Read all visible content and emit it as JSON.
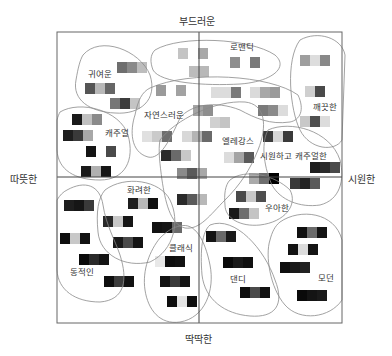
{
  "axes": {
    "top": "부드러운",
    "bottom": "딱딱한",
    "left": "따뜻한",
    "right": "시원한"
  },
  "frame": {
    "x": 57,
    "y": 32,
    "w": 285,
    "h": 291,
    "cx": 199,
    "cy": 177
  },
  "clusters": [
    {
      "id": "cute",
      "label": "귀여운",
      "lx": 88,
      "ly": 70,
      "path": "M 83 55 C 100 35, 140 50, 150 75 C 158 100, 140 115, 115 113 C 90 112, 72 100, 76 80 C 78 68, 80 60, 83 55 Z"
    },
    {
      "id": "romantic",
      "label": "로맨틱",
      "lx": 230,
      "ly": 43,
      "path": "M 155 50 C 180 35, 250 38, 275 55 C 290 68, 270 82, 240 84 C 205 86, 160 83, 153 70 C 150 62, 150 55, 155 50 Z"
    },
    {
      "id": "clean",
      "label": "깨끗한",
      "lx": 313,
      "ly": 103,
      "path": "M 300 40 C 318 30, 342 38, 345 55 L 342 140 C 335 152, 310 150, 300 130 C 290 110, 285 60, 300 40 Z"
    },
    {
      "id": "natural",
      "label": "자연스러운",
      "lx": 144,
      "ly": 111,
      "path": "M 150 88 C 190 70, 270 75, 298 95 C 305 110, 300 120, 290 122 C 270 125, 255 118, 240 110 C 215 100, 190 105, 180 118 C 170 140, 160 160, 148 157 C 130 152, 130 130, 135 115 C 138 100, 142 92, 150 88 Z"
    },
    {
      "id": "casual",
      "label": "캐주얼",
      "lx": 105,
      "ly": 129,
      "path": "M 60 112 C 80 100, 120 110, 128 135 C 135 160, 125 180, 100 180 C 75 180, 58 170, 57 150 L 57 120 C 58 116, 59 114, 60 112 Z"
    },
    {
      "id": "elegance",
      "label": "엘레강스",
      "lx": 222,
      "ly": 137,
      "path": "M 160 140 C 175 120, 215 100, 245 102 C 265 104, 268 125, 258 150 C 250 170, 240 185, 225 200 C 210 215, 200 230, 185 228 C 170 225, 165 200, 162 180 C 160 165, 158 150, 160 140 Z"
    },
    {
      "id": "cool-casual",
      "label": "시원하고 캐주얼한",
      "lx": 260,
      "ly": 152,
      "path": "M 268 130 C 290 120, 330 130, 340 160 C 345 180, 340 200, 320 205 C 300 208, 280 200, 272 185 C 265 170, 260 145, 268 130 Z"
    },
    {
      "id": "elegant",
      "label": "우아한",
      "lx": 265,
      "ly": 204,
      "path": "M 230 180 C 245 168, 275 175, 290 190 C 298 205, 285 222, 260 225 C 240 227, 225 218, 225 205 C 224 195, 225 185, 230 180 Z"
    },
    {
      "id": "gorgeous",
      "label": "화려한",
      "lx": 127,
      "ly": 186,
      "path": "M 105 190 C 125 175, 160 180, 170 200 C 180 220, 175 250, 150 262 C 125 268, 100 255, 98 232 C 96 212, 98 198, 105 190 Z"
    },
    {
      "id": "dynamic",
      "label": "동적인",
      "lx": 70,
      "ly": 268,
      "path": "M 67 190 C 85 180, 100 185, 103 205 C 106 225, 115 240, 120 255 C 128 280, 125 300, 100 302 C 75 302, 58 290, 57 270 L 57 200 C 60 195, 63 192, 67 190 Z"
    },
    {
      "id": "classic",
      "label": "클래식",
      "lx": 169,
      "ly": 244,
      "path": "M 180 226 C 195 222, 205 240, 210 265 C 215 290, 205 318, 180 322 C 160 325, 148 310, 145 290 C 142 270, 150 250, 160 238 C 168 230, 174 227, 180 226 Z"
    },
    {
      "id": "dandy",
      "label": "댄디",
      "lx": 230,
      "ly": 275,
      "path": "M 210 225 C 235 215, 265 250, 275 280 C 285 305, 275 318, 250 316 C 225 314, 205 300, 202 275 C 200 250, 202 232, 210 225 Z"
    },
    {
      "id": "modern",
      "label": "모던",
      "lx": 318,
      "ly": 274,
      "path": "M 280 222 C 300 208, 335 212, 342 240 L 342 300 C 330 318, 300 322, 285 305 C 270 288, 265 255, 270 240 C 272 232, 275 226, 280 222 Z"
    }
  ],
  "swatches": [
    {
      "x": 117,
      "y": 62,
      "colors": [
        "#6e6e6e",
        "#8a8a8a",
        "#bdbdbd"
      ]
    },
    {
      "x": 85,
      "y": 83,
      "colors": [
        "#555555",
        "#b8b8b8",
        "#666666"
      ]
    },
    {
      "x": 110,
      "y": 98,
      "colors": [
        "#777777",
        "#3c3c3c",
        "#c4c4c4"
      ]
    },
    {
      "x": 72,
      "y": 114,
      "colors": [
        "#1a1a1a",
        "#c0c0c0",
        "#8a8a8a"
      ]
    },
    {
      "x": 63,
      "y": 130,
      "colors": [
        "#1e1e1e",
        "#3a3a3a",
        "#a8a8a8"
      ]
    },
    {
      "x": 86,
      "y": 146,
      "colors": [
        "#141414",
        "#ffffff",
        "#4a4a4a"
      ]
    },
    {
      "x": 81,
      "y": 166,
      "colors": [
        "#1a1a1a",
        "#b0b0b0",
        "#161616"
      ]
    },
    {
      "x": 178,
      "y": 48,
      "colors": [
        "#c4c4c4",
        "#ffffff",
        "#a8a8a8"
      ]
    },
    {
      "x": 189,
      "y": 66,
      "colors": [
        "#bcbcbc",
        "#b8b8b8",
        "#ffffff"
      ]
    },
    {
      "x": 230,
      "y": 57,
      "colors": [
        "#8e8e8e",
        "#ffffff",
        "#7a7a7a"
      ]
    },
    {
      "x": 300,
      "y": 55,
      "colors": [
        "#9e9e9e",
        "#dddddd",
        "#888888"
      ]
    },
    {
      "x": 305,
      "y": 86,
      "colors": [
        "#cfcfcf",
        "#4a4a4a",
        "#ffffff"
      ]
    },
    {
      "x": 300,
      "y": 116,
      "colors": [
        "#c8c8c8",
        "#4f4f4f",
        "#dcdcdc"
      ]
    },
    {
      "x": 156,
      "y": 85,
      "colors": [
        "#9a9a9a",
        "#ffffff",
        "#a2a2a2"
      ]
    },
    {
      "x": 211,
      "y": 87,
      "colors": [
        "#dcdcdc",
        "#dcdcdc",
        "#7a7a7a"
      ]
    },
    {
      "x": 250,
      "y": 87,
      "colors": [
        "#dadada",
        "#a8a8a8",
        "#9a9a9a"
      ]
    },
    {
      "x": 183,
      "y": 105,
      "colors": [
        "#ffffff",
        "#a4a4a4",
        "#8e8e8e"
      ]
    },
    {
      "x": 258,
      "y": 105,
      "colors": [
        "#7a7a7a",
        "#8a8a8a",
        "#dcdcdc"
      ]
    },
    {
      "x": 210,
      "y": 117,
      "colors": [
        "#d0d0d0",
        "#c4c4c4",
        "#ffffff"
      ]
    },
    {
      "x": 142,
      "y": 131,
      "colors": [
        "#e0e0e0",
        "#cacaca",
        "#6e6e6e"
      ]
    },
    {
      "x": 182,
      "y": 131,
      "colors": [
        "#d8d8d8",
        "#b4b4b4",
        "#6a6a6a"
      ]
    },
    {
      "x": 161,
      "y": 150,
      "colors": [
        "#2a2a2a",
        "#6a6a6a",
        "#c8c8c8"
      ]
    },
    {
      "x": 177,
      "y": 168,
      "colors": [
        "#8a8a8a",
        "#5a5a5a",
        "#a8a8a8"
      ]
    },
    {
      "x": 224,
      "y": 152,
      "colors": [
        "#dcdcdc",
        "#a4a4a4",
        "#5a5a5a"
      ]
    },
    {
      "x": 263,
      "y": 131,
      "colors": [
        "#3c3c3c",
        "#d6d6d6",
        "#3a3a3a"
      ]
    },
    {
      "x": 310,
      "y": 162,
      "colors": [
        "#1e1e1e",
        "#2a2a2a",
        "#4a4a4a"
      ]
    },
    {
      "x": 249,
      "y": 173,
      "colors": [
        "#aaaaaa",
        "#6e6e6e",
        "#000000"
      ]
    },
    {
      "x": 290,
      "y": 178,
      "colors": [
        "#3a3a3a",
        "#222222",
        "#5a5a5a"
      ]
    },
    {
      "x": 236,
      "y": 191,
      "colors": [
        "#4a4a4a",
        "#c8c8c8",
        "#4e4e4e"
      ]
    },
    {
      "x": 229,
      "y": 208,
      "colors": [
        "#1a1a1a",
        "#6e6e6e",
        "#c4c4c4"
      ]
    },
    {
      "x": 177,
      "y": 194,
      "colors": [
        "#2a2a2a",
        "#5a5a5a",
        "#b8b8b8"
      ]
    },
    {
      "x": 64,
      "y": 200,
      "colors": [
        "#1e1e1e",
        "#161616",
        "#3a3a3a"
      ]
    },
    {
      "x": 128,
      "y": 198,
      "colors": [
        "#1e1e1e",
        "#b8b8b8",
        "#101010"
      ]
    },
    {
      "x": 103,
      "y": 216,
      "colors": [
        "#2a2a2a",
        "#c8c8c8",
        "#161616"
      ]
    },
    {
      "x": 152,
      "y": 222,
      "colors": [
        "#121212",
        "#161616",
        "#6a6a6a"
      ]
    },
    {
      "x": 60,
      "y": 233,
      "colors": [
        "#0e0e0e",
        "#c8c8c8",
        "#121212"
      ]
    },
    {
      "x": 113,
      "y": 237,
      "colors": [
        "#1a1a1a",
        "#4a4a4a",
        "#141414"
      ]
    },
    {
      "x": 79,
      "y": 254,
      "colors": [
        "#0a0a0a",
        "#2a2a2a",
        "#141414"
      ]
    },
    {
      "x": 104,
      "y": 276,
      "colors": [
        "#0e0e0e",
        "#3c3c3c",
        "#121212"
      ]
    },
    {
      "x": 155,
      "y": 256,
      "colors": [
        "#e8e8e8",
        "#0e0e0e",
        "#121212"
      ]
    },
    {
      "x": 160,
      "y": 276,
      "colors": [
        "#121212",
        "#3a3a3a",
        "#141414"
      ]
    },
    {
      "x": 167,
      "y": 296,
      "colors": [
        "#0e0e0e",
        "#e4e4e4",
        "#0e0e0e"
      ]
    },
    {
      "x": 206,
      "y": 231,
      "colors": [
        "#141414",
        "#6a6a6a",
        "#1a1a1a"
      ]
    },
    {
      "x": 223,
      "y": 257,
      "colors": [
        "#0a0a0a",
        "#1a1a1a",
        "#101010"
      ]
    },
    {
      "x": 240,
      "y": 287,
      "colors": [
        "#0e0e0e",
        "#4a4a4a",
        "#121212"
      ]
    },
    {
      "x": 297,
      "y": 227,
      "colors": [
        "#101010",
        "#6a6a6a",
        "#141414"
      ]
    },
    {
      "x": 288,
      "y": 244,
      "colors": [
        "#121212",
        "#dcdcdc",
        "#141414"
      ]
    },
    {
      "x": 280,
      "y": 262,
      "colors": [
        "#0e0e0e",
        "#1a1a1a",
        "#222222"
      ]
    },
    {
      "x": 297,
      "y": 290,
      "colors": [
        "#0a0a0a",
        "#141414",
        "#1a1a1a"
      ]
    }
  ],
  "swatch_size": {
    "cell_w": 10,
    "h": 11
  },
  "colors": {
    "frame": "#666666",
    "axis": "#444444",
    "outline": "#8a8a8a"
  }
}
